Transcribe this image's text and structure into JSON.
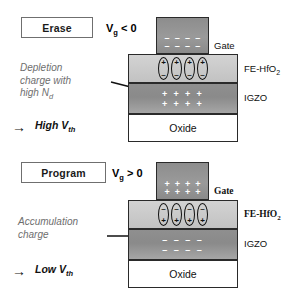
{
  "figure": {
    "type": "device-cross-section-diagram"
  },
  "panels": [
    {
      "id": "erase",
      "mode_label": "Erase",
      "bias_label": "V",
      "bias_sub": "g",
      "bias_rel": "< 0",
      "annotation": "Depletion\ncharge with\nhigh N",
      "annotation_sub": "d",
      "conclusion_arrow": "→",
      "conclusion": "High V",
      "conclusion_sub": "th",
      "layers": [
        {
          "name": "Gate",
          "label": "Gate",
          "label_side": "right",
          "label_font": "sans"
        },
        {
          "name": "FE-HfO2",
          "label": "FE-HfO",
          "label_sub": "2",
          "label_side": "right",
          "label_font": "sans"
        },
        {
          "name": "IGZO",
          "label": "IGZO",
          "label_side": "right",
          "label_font": "sans"
        },
        {
          "name": "Oxide",
          "label": "Oxide",
          "label_side": "center",
          "label_font": "sans"
        }
      ],
      "gate_charge_sign": "–",
      "gate_charge_rows": 2,
      "gate_charge_cols": 4,
      "dipole_top_sign": "+",
      "dipole_bottom_sign": "–",
      "dipole_count": 4,
      "igzo_charge_sign": "+",
      "igzo_charge_rows": 2,
      "igzo_charge_cols": 4
    },
    {
      "id": "program",
      "mode_label": "Program",
      "bias_label": "V",
      "bias_sub": "g",
      "bias_rel": "> 0",
      "annotation": "Accumulation\ncharge",
      "annotation_sub": "",
      "conclusion_arrow": "→",
      "conclusion": "Low V",
      "conclusion_sub": "th",
      "layers": [
        {
          "name": "Gate",
          "label": "Gate",
          "label_side": "right",
          "label_font": "serif"
        },
        {
          "name": "FE-HfO2",
          "label": "FE-HfO",
          "label_sub": "2",
          "label_side": "right",
          "label_font": "serif"
        },
        {
          "name": "IGZO",
          "label": "IGZO",
          "label_side": "right",
          "label_font": "sans"
        },
        {
          "name": "Oxide",
          "label": "Oxide",
          "label_side": "center",
          "label_font": "sans"
        }
      ],
      "gate_charge_sign": "+",
      "gate_charge_rows": 2,
      "gate_charge_cols": 4,
      "dipole_top_sign": "–",
      "dipole_bottom_sign": "+",
      "dipole_count": 4,
      "igzo_charge_sign": "–",
      "igzo_charge_rows": 2,
      "igzo_charge_cols": 4
    }
  ],
  "colors": {
    "gate_fill": "#949494",
    "fe_fill": "#cbcbcb",
    "igzo_fill": "#909090",
    "oxide_fill": "#ffffff",
    "outline": "#2a2a2a",
    "annotation_text": "#6e6e6e",
    "mode_box_border": "#6f6f6f",
    "background": "#ffffff"
  }
}
